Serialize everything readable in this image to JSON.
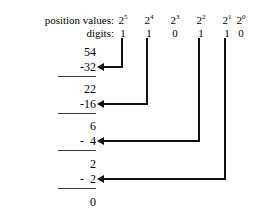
{
  "labels": {
    "position_values": "position values:",
    "digits": "digits:"
  },
  "columns": [
    {
      "base": "2",
      "exponent": "5",
      "power_label": "2⁵",
      "digit": "1",
      "value": 32
    },
    {
      "base": "2",
      "exponent": "4",
      "power_label": "2⁴",
      "digit": "1",
      "value": 16
    },
    {
      "base": "2",
      "exponent": "3",
      "power_label": "2³",
      "digit": "0",
      "value": 8
    },
    {
      "base": "2",
      "exponent": "2",
      "power_label": "2²",
      "digit": "1",
      "value": 4
    },
    {
      "base": "2",
      "exponent": "1",
      "power_label": "2¹",
      "digit": "1",
      "value": 2
    },
    {
      "base": "2",
      "exponent": "0",
      "power_label": "2⁰",
      "digit": "0",
      "value": 1
    }
  ],
  "steps": [
    {
      "remainder": "54",
      "subtrahend": "-32",
      "source_column": 0
    },
    {
      "remainder": "22",
      "subtrahend": "-16",
      "source_column": 1
    },
    {
      "remainder": "6",
      "subtrahend": "-  4",
      "source_column": 3
    },
    {
      "remainder": "2",
      "subtrahend": "-  2",
      "source_column": 4
    }
  ],
  "final_remainder": "0",
  "colors": {
    "ink": "#000000",
    "connector": "#111111",
    "rule": "#3a3a3a",
    "background": "#ffffff"
  }
}
